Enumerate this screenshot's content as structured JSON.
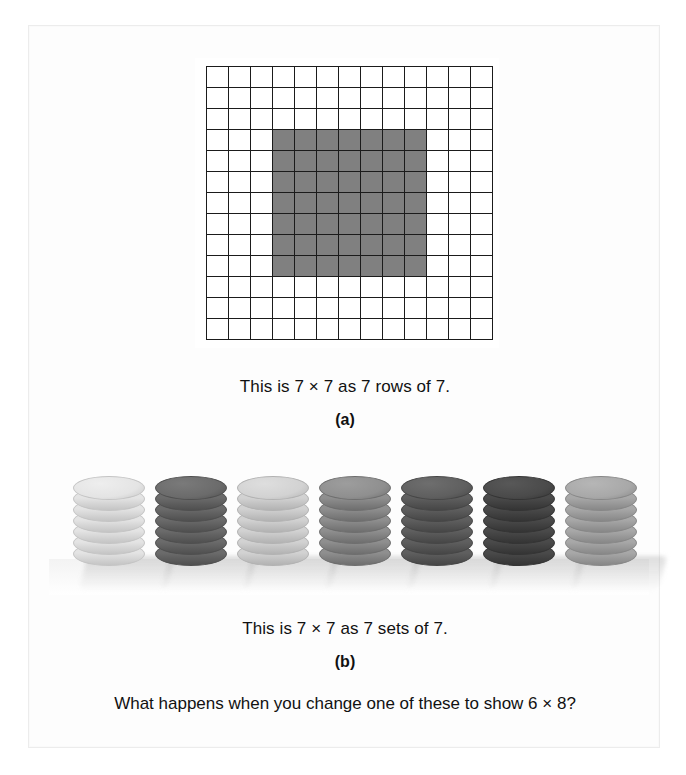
{
  "page": {
    "background_color": "#ffffff",
    "frame_color": "#ececec"
  },
  "figure_a": {
    "caption": "This is 7 × 7 as 7 rows of 7.",
    "label": "(a)",
    "grid": {
      "columns": 13,
      "rows": 13,
      "cell_line_color": "#1b1b1b",
      "cell_fill_color": "#ffffff",
      "shaded_fill_color": "#808080",
      "shaded_block": {
        "start_column": 4,
        "start_row": 4,
        "width": 7,
        "height": 7
      }
    }
  },
  "figure_b": {
    "caption": "This is 7 × 7 as 7 sets of 7.",
    "label": "(b)",
    "stacks": [
      {
        "index": 1,
        "coins": 7,
        "color": "#e4e4e4",
        "edge": "#c4c4c4",
        "top": "#eeeeee",
        "left": 44
      },
      {
        "index": 2,
        "coins": 7,
        "color": "#6b6b6b",
        "edge": "#4f4f4f",
        "top": "#7a7a7a",
        "left": 126
      },
      {
        "index": 3,
        "coins": 7,
        "color": "#d2d2d2",
        "edge": "#b2b2b2",
        "top": "#dedede",
        "left": 208
      },
      {
        "index": 4,
        "coins": 7,
        "color": "#8f8f8f",
        "edge": "#6e6e6e",
        "top": "#9d9d9d",
        "left": 290
      },
      {
        "index": 5,
        "coins": 7,
        "color": "#5f5f5f",
        "edge": "#464646",
        "top": "#6e6e6e",
        "left": 372
      },
      {
        "index": 6,
        "coins": 7,
        "color": "#4a4a4a",
        "edge": "#343434",
        "top": "#585858",
        "left": 454
      },
      {
        "index": 7,
        "coins": 7,
        "color": "#a8a8a8",
        "edge": "#878787",
        "top": "#b6b6b6",
        "left": 536
      }
    ]
  },
  "question": {
    "text": "What happens when you change one of these to show 6 × 8?"
  }
}
